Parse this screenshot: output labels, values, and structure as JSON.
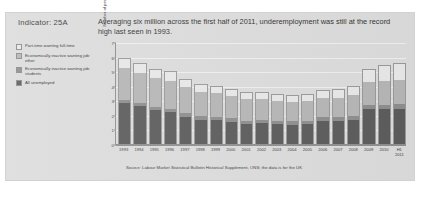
{
  "indicator": {
    "label": "Indicator: 25A"
  },
  "headline": {
    "text": "Averaging six million across the first half of 2011, underemployment was still at the record high last seen in 1993."
  },
  "legend": {
    "items": [
      {
        "label": "Part-time wanting full-time",
        "color": "#e8e8e8"
      },
      {
        "label": "Economically inactive wanting job: other",
        "color": "#b6b6b6"
      },
      {
        "label": "Economically inactive wanting job: students",
        "color": "#8e8e8e"
      },
      {
        "label": "All unemployed",
        "color": "#5c5c5c"
      }
    ]
  },
  "source": {
    "text": "Source: Labour Market Statistical Bulletin Historical Supplement, ONS; the data is for the UK"
  },
  "chart_data": {
    "type": "bar",
    "stacked": true,
    "title": "",
    "xlabel": "",
    "ylabel": "Number of people (millions)",
    "ylim": [
      0,
      7
    ],
    "yticks": [
      0,
      1,
      2,
      3,
      4,
      5,
      6,
      7
    ],
    "grid": true,
    "legend_position": "left",
    "categories": [
      "1993",
      "1994",
      "1995",
      "1996",
      "1997",
      "1998",
      "1999",
      "2000",
      "2001",
      "2002",
      "2003",
      "2004",
      "2005",
      "2006",
      "2007",
      "2008",
      "2009",
      "2010",
      "H1 2011"
    ],
    "series": [
      {
        "name": "All unemployed",
        "color": "#5c5c5c",
        "values": [
          2.9,
          2.65,
          2.4,
          2.25,
          1.95,
          1.75,
          1.7,
          1.6,
          1.45,
          1.5,
          1.45,
          1.4,
          1.45,
          1.65,
          1.65,
          1.75,
          2.45,
          2.45,
          2.45
        ]
      },
      {
        "name": "Economically inactive wanting job: students",
        "color": "#8e8e8e",
        "values": [
          0.22,
          0.22,
          0.22,
          0.22,
          0.22,
          0.22,
          0.22,
          0.22,
          0.22,
          0.22,
          0.22,
          0.22,
          0.22,
          0.24,
          0.24,
          0.26,
          0.3,
          0.32,
          0.34
        ]
      },
      {
        "name": "Economically inactive wanting job: other",
        "color": "#b6b6b6",
        "values": [
          2.18,
          2.08,
          1.98,
          1.93,
          1.78,
          1.68,
          1.63,
          1.53,
          1.48,
          1.43,
          1.38,
          1.33,
          1.33,
          1.36,
          1.36,
          1.39,
          1.55,
          1.63,
          1.66
        ]
      },
      {
        "name": "Part-time wanting full-time",
        "color": "#e8e8e8",
        "values": [
          0.7,
          0.7,
          0.65,
          0.65,
          0.6,
          0.55,
          0.5,
          0.5,
          0.48,
          0.48,
          0.48,
          0.48,
          0.5,
          0.55,
          0.58,
          0.65,
          0.95,
          1.1,
          1.2
        ]
      }
    ],
    "totals": [
      6.0,
      5.65,
      5.25,
      5.05,
      4.55,
      4.2,
      4.05,
      3.85,
      3.63,
      3.63,
      3.53,
      3.43,
      3.5,
      3.8,
      3.83,
      4.05,
      5.25,
      5.5,
      5.65
    ]
  }
}
